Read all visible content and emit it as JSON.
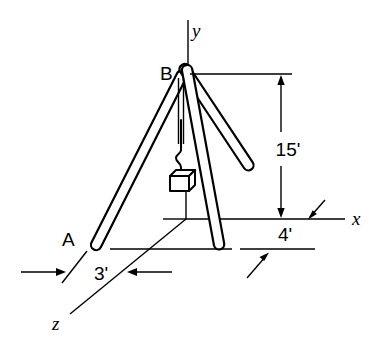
{
  "figure": {
    "background_color": "#ffffff",
    "line_color": "#000000"
  },
  "labels": {
    "apex": "B",
    "foot_a": "A",
    "axis_x": "x",
    "axis_y": "y",
    "axis_z": "z"
  },
  "dimensions": [
    {
      "id": "height",
      "value": "15'",
      "orientation": "vertical",
      "arrows": "both"
    },
    {
      "id": "x_offset",
      "value": "4'",
      "orientation": "diagonal",
      "arrows": "both"
    },
    {
      "id": "z_offset",
      "value": "3'",
      "orientation": "diagonal",
      "arrows": "both"
    }
  ],
  "geometry": {
    "apex": {
      "x": 181,
      "y": 74
    },
    "origin": {
      "x": 186,
      "y": 219
    },
    "foot_a": {
      "x": 96,
      "y": 247
    },
    "foot_front": {
      "x": 219,
      "y": 250
    },
    "foot_right": {
      "x": 249,
      "y": 172
    },
    "axis_x_end": {
      "x": 345,
      "y": 219
    },
    "axis_y_top": {
      "x": 188,
      "y": 20
    },
    "axis_z_end": {
      "x": 70,
      "y": 314
    }
  }
}
